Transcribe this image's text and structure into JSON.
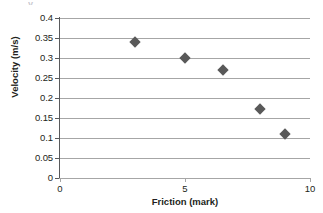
{
  "figure": {
    "cropped_text_above": "y",
    "background_color": "#ffffff"
  },
  "chart_data": {
    "type": "scatter",
    "title": "",
    "xlabel": "Friction (mark)",
    "ylabel": "Velocity (m/s)",
    "x": [
      3,
      5,
      6.5,
      8,
      9
    ],
    "values": [
      0.34,
      0.3,
      0.27,
      0.172,
      0.11
    ],
    "series": [
      {
        "name": "Velocity vs Friction",
        "x": [
          3,
          5,
          6.5,
          8,
          9
        ],
        "values": [
          0.34,
          0.3,
          0.27,
          0.172,
          0.11
        ],
        "marker": "diamond",
        "color": "#595959"
      }
    ],
    "xlim": [
      0,
      10
    ],
    "ylim": [
      0,
      0.4
    ],
    "xticks": [
      "0",
      "5",
      "10"
    ],
    "xtick_values": [
      0,
      5,
      10
    ],
    "yticks": [
      "0",
      "0.05",
      "0.1",
      "0.15",
      "0.2",
      "0.25",
      "0.3",
      "0.35",
      "0.4"
    ],
    "ytick_values": [
      0,
      0.05,
      0.1,
      0.15,
      0.2,
      0.25,
      0.3,
      0.35,
      0.4
    ],
    "grid": "horizontal",
    "gridline_color": "#a6a6a6",
    "legend": "none"
  }
}
